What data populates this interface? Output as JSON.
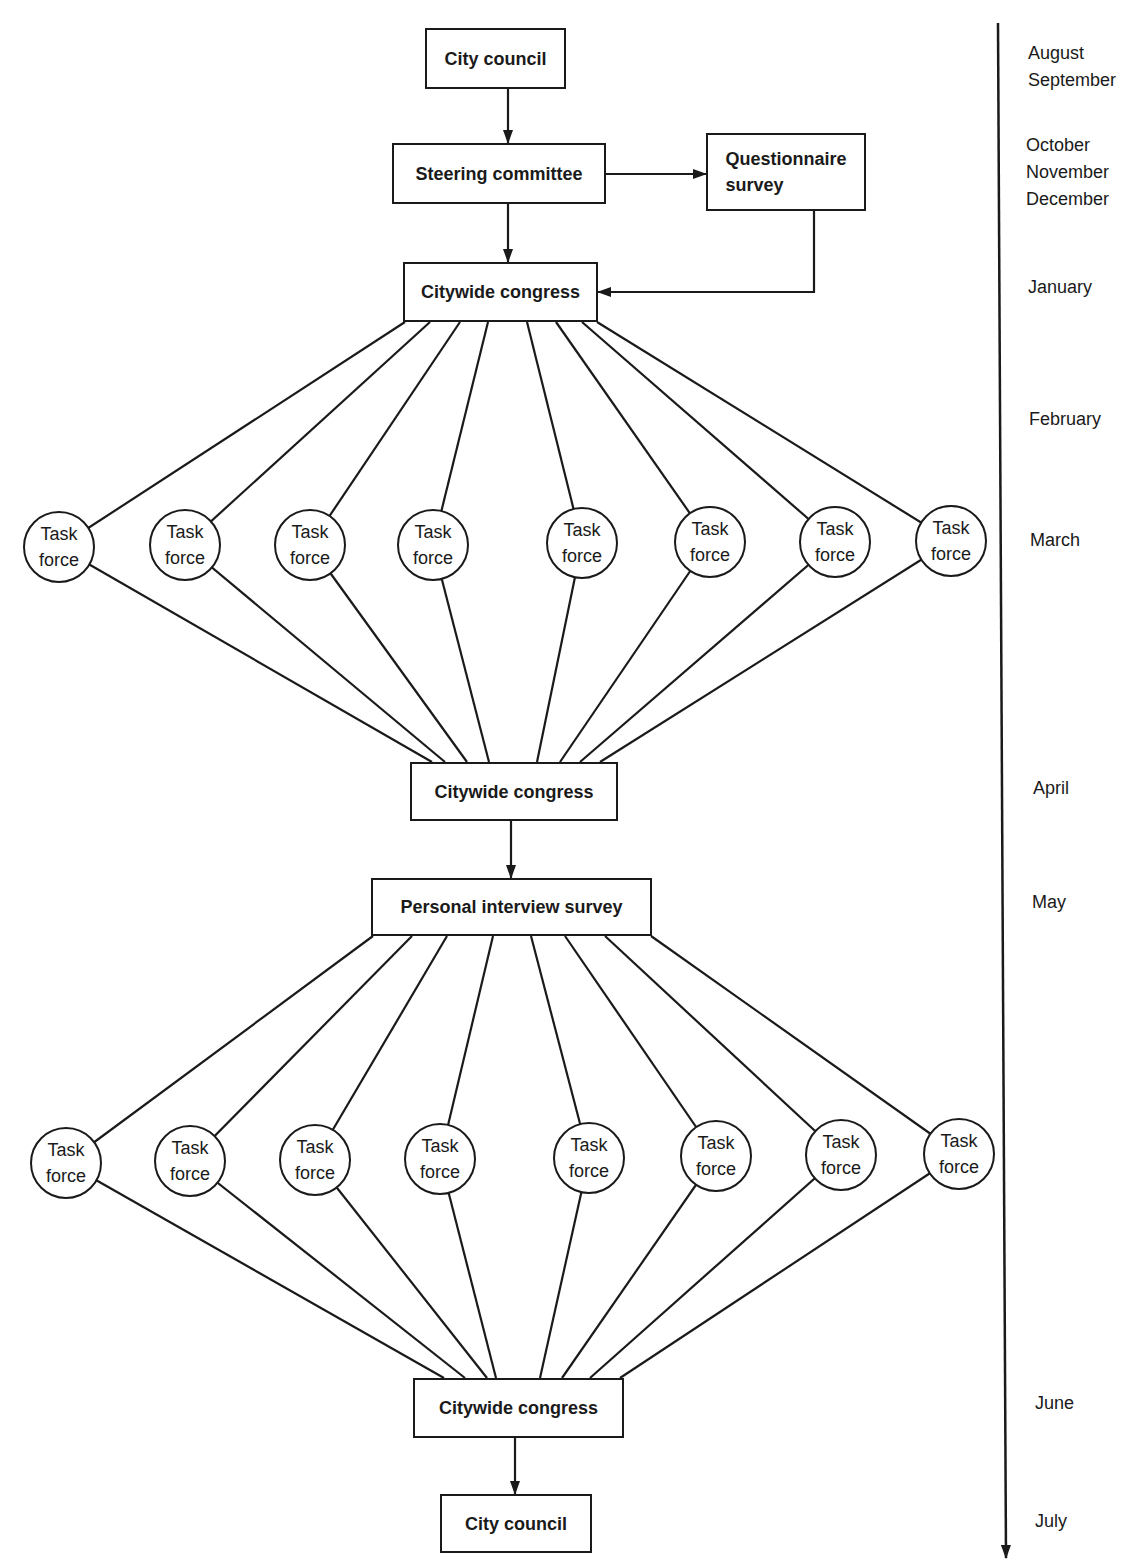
{
  "diagram": {
    "title": "",
    "colors": {
      "ink": "#1a1a1a",
      "background": "#ffffff"
    },
    "boxes": [
      {
        "id": "city_council_top",
        "label": "City council",
        "x": 425,
        "y": 28,
        "w": 141,
        "h": 61
      },
      {
        "id": "steering_committee",
        "label": "Steering committee",
        "x": 392,
        "y": 143,
        "w": 214,
        "h": 61
      },
      {
        "id": "questionnaire_survey",
        "label": "Questionnaire\nsurvey",
        "x": 706,
        "y": 133,
        "w": 160,
        "h": 78
      },
      {
        "id": "citywide_congress_1",
        "label": "Citywide congress",
        "x": 403,
        "y": 262,
        "w": 195,
        "h": 60
      },
      {
        "id": "citywide_congress_2",
        "label": "Citywide congress",
        "x": 410,
        "y": 762,
        "w": 208,
        "h": 59
      },
      {
        "id": "personal_interview_survey",
        "label": "Personal interview survey",
        "x": 371,
        "y": 878,
        "w": 281,
        "h": 58
      },
      {
        "id": "citywide_congress_3",
        "label": "Citywide congress",
        "x": 413,
        "y": 1378,
        "w": 211,
        "h": 60
      },
      {
        "id": "city_council_bottom",
        "label": "City council",
        "x": 440,
        "y": 1494,
        "w": 152,
        "h": 59
      }
    ],
    "task_force_label": [
      "Task",
      "force"
    ],
    "task_forces_row1": [
      {
        "cx": 59,
        "cy": 547
      },
      {
        "cx": 185,
        "cy": 545
      },
      {
        "cx": 310,
        "cy": 545
      },
      {
        "cx": 433,
        "cy": 545
      },
      {
        "cx": 582,
        "cy": 543
      },
      {
        "cx": 710,
        "cy": 542
      },
      {
        "cx": 835,
        "cy": 542
      },
      {
        "cx": 951,
        "cy": 541
      }
    ],
    "task_forces_row2": [
      {
        "cx": 66,
        "cy": 1163
      },
      {
        "cx": 190,
        "cy": 1161
      },
      {
        "cx": 315,
        "cy": 1160
      },
      {
        "cx": 440,
        "cy": 1159
      },
      {
        "cx": 589,
        "cy": 1158
      },
      {
        "cx": 716,
        "cy": 1156
      },
      {
        "cx": 841,
        "cy": 1155
      },
      {
        "cx": 959,
        "cy": 1154
      }
    ],
    "fan_sources": {
      "row1_top_x": [
        405,
        430,
        460,
        488,
        527,
        556,
        582,
        597
      ],
      "row1_top_y": 322,
      "row1_bottom_x": [
        432,
        445,
        467,
        489,
        537,
        560,
        580,
        600
      ],
      "row1_bottom_y": 762,
      "row2_top_x": [
        373,
        412,
        447,
        493,
        531,
        565,
        605,
        651
      ],
      "row2_top_y": 936,
      "row2_bottom_x": [
        444,
        465,
        487,
        496,
        540,
        562,
        590,
        620
      ],
      "row2_bottom_y": 1378
    },
    "arrows": [
      {
        "from": "city_council_top",
        "to": "steering_committee",
        "points": [
          [
            508,
            89
          ],
          [
            508,
            143
          ]
        ]
      },
      {
        "from": "steering_committee",
        "to": "questionnaire_survey",
        "points": [
          [
            606,
            174
          ],
          [
            706,
            174
          ]
        ]
      },
      {
        "from": "steering_committee",
        "to": "citywide_congress_1",
        "points": [
          [
            508,
            204
          ],
          [
            508,
            262
          ]
        ]
      },
      {
        "from": "questionnaire_survey",
        "to": "citywide_congress_1",
        "points": [
          [
            814,
            211
          ],
          [
            814,
            292
          ],
          [
            598,
            292
          ]
        ]
      },
      {
        "from": "citywide_congress_2",
        "to": "personal_interview_survey",
        "points": [
          [
            511,
            821
          ],
          [
            511,
            878
          ]
        ]
      },
      {
        "from": "citywide_congress_3",
        "to": "city_council_bottom",
        "points": [
          [
            515,
            1438
          ],
          [
            515,
            1494
          ]
        ]
      }
    ],
    "timeline": {
      "line": {
        "x1": 998,
        "y1": 23,
        "x2": 1006,
        "y2": 1558
      },
      "months": [
        {
          "label": "August\nSeptember",
          "x": 1028,
          "y": 40
        },
        {
          "label": "October\nNovember\nDecember",
          "x": 1026,
          "y": 132
        },
        {
          "label": "January",
          "x": 1028,
          "y": 274
        },
        {
          "label": "February",
          "x": 1029,
          "y": 406
        },
        {
          "label": "March",
          "x": 1030,
          "y": 527
        },
        {
          "label": "April",
          "x": 1033,
          "y": 775
        },
        {
          "label": "May",
          "x": 1032,
          "y": 889
        },
        {
          "label": "June",
          "x": 1035,
          "y": 1390
        },
        {
          "label": "July",
          "x": 1035,
          "y": 1508
        }
      ]
    }
  }
}
